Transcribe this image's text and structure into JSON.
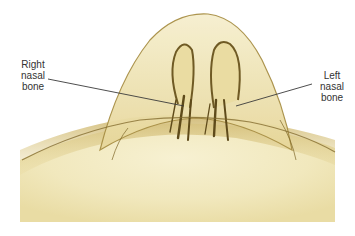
{
  "figure": {
    "labels": {
      "right": [
        "Right",
        "nasal",
        "bone"
      ],
      "left": [
        "Left",
        "nasal",
        "bone"
      ]
    },
    "colors": {
      "background": "#ffffff",
      "tissue_light": "#f3ecc4",
      "tissue_mid": "#d8c37e",
      "bone_dark": "#6b5520",
      "leader_line": "#3a3a3a",
      "label_text": "#333333"
    }
  }
}
